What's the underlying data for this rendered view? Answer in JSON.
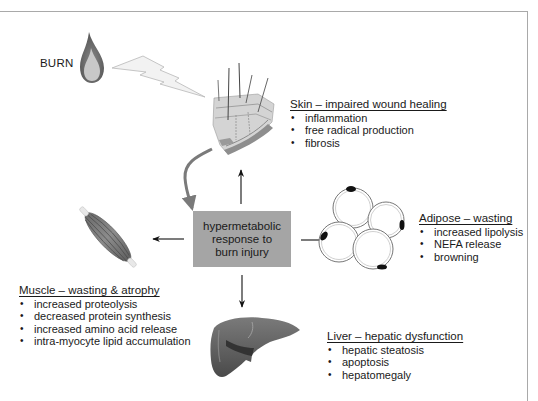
{
  "burn": {
    "label": "BURN"
  },
  "center": {
    "lines": [
      "hypermetabolic",
      "response to",
      "burn injury"
    ]
  },
  "skin": {
    "title": "Skin – impaired wound healing",
    "items": [
      "inflammation",
      "free radical production",
      "fibrosis"
    ]
  },
  "adipose": {
    "title": "Adipose – wasting",
    "items": [
      "increased lipolysis",
      "NEFA release",
      "browning"
    ]
  },
  "muscle": {
    "title": "Muscle – wasting & atrophy",
    "items": [
      "increased proteolysis",
      "decreased protein synthesis",
      "increased amino acid release",
      "intra-myocyte lipid accumulation"
    ]
  },
  "liver": {
    "title": "Liver – hepatic dysfunction",
    "items": [
      "hepatic steatosis",
      "apoptosis",
      "hepatomegaly"
    ]
  },
  "icons": {
    "burn": "flame-icon",
    "impact": "lightning-bolt-icon",
    "skin": "skin-cross-section-icon",
    "muscle": "muscle-icon",
    "adipose": "adipocytes-icon",
    "liver": "liver-icon"
  },
  "colors": {
    "center_box": "#a5a5a5",
    "frame": "#a9a9a9",
    "curved_arrow": "#7a7a7a",
    "arrows": "#111111"
  }
}
